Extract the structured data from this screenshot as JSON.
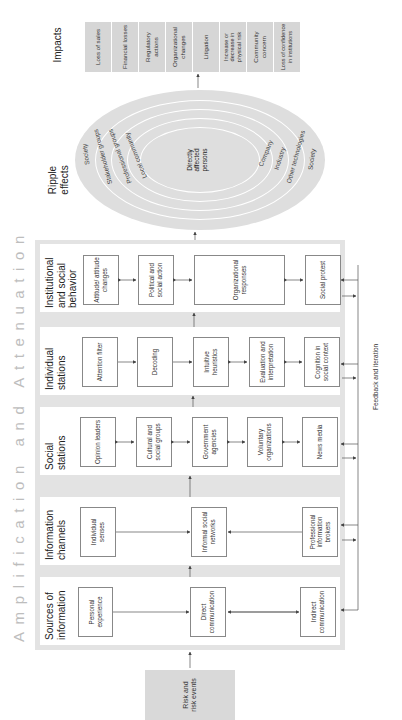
{
  "risk_events": {
    "label": "Risk and risk events"
  },
  "amplification": {
    "title": "Amplification and Attenuation"
  },
  "columns": [
    {
      "title": "Sources of information",
      "nodes": [
        "Personal experience",
        "Direct communication",
        "Indirect communication"
      ]
    },
    {
      "title": "Information channels",
      "nodes": [
        "Individual senses",
        "Informal social networks",
        "Professional information brokers"
      ]
    },
    {
      "title": "Social stations",
      "nodes": [
        "Opinion leaders",
        "Cultural and social groups",
        "Government agencies",
        "Voluntary organizations",
        "News media"
      ]
    },
    {
      "title": "Individual stations",
      "nodes": [
        "Attention filter",
        "Decoding",
        "Intuitive heuristics",
        "Evaluation and interpretation",
        "Cognition in social context"
      ]
    },
    {
      "title": "Institutional and social behavior",
      "nodes": [
        "Attitude/ attitude changes",
        "Political and social action",
        "Organizational responses",
        "Social protest"
      ]
    }
  ],
  "feedback": {
    "label": "Feedback and iteration"
  },
  "ripple": {
    "title": "Ripple effects",
    "center": "Directly affected persons",
    "rings_left": [
      "Society",
      "Stakeholder groups",
      "Professional groups",
      "Local community"
    ],
    "rings_right": [
      "Society",
      "Other technologies",
      "Industry",
      "Company"
    ]
  },
  "impacts": {
    "title": "Impacts",
    "items": [
      "Loss of sales",
      "Financial losses",
      "Regulatory actions",
      "Organizational changes",
      "Litigation",
      "Increase or decrease in physical risk",
      "Community concern",
      "Loss of confidence in institutions"
    ]
  },
  "colors": {
    "panel": "#e3e3e3",
    "risk_box": "#d9d9d9",
    "ellipse": "#dedede",
    "impact": "#d6d6d6",
    "title_faint": "#bdbdbd",
    "line": "#555555"
  }
}
